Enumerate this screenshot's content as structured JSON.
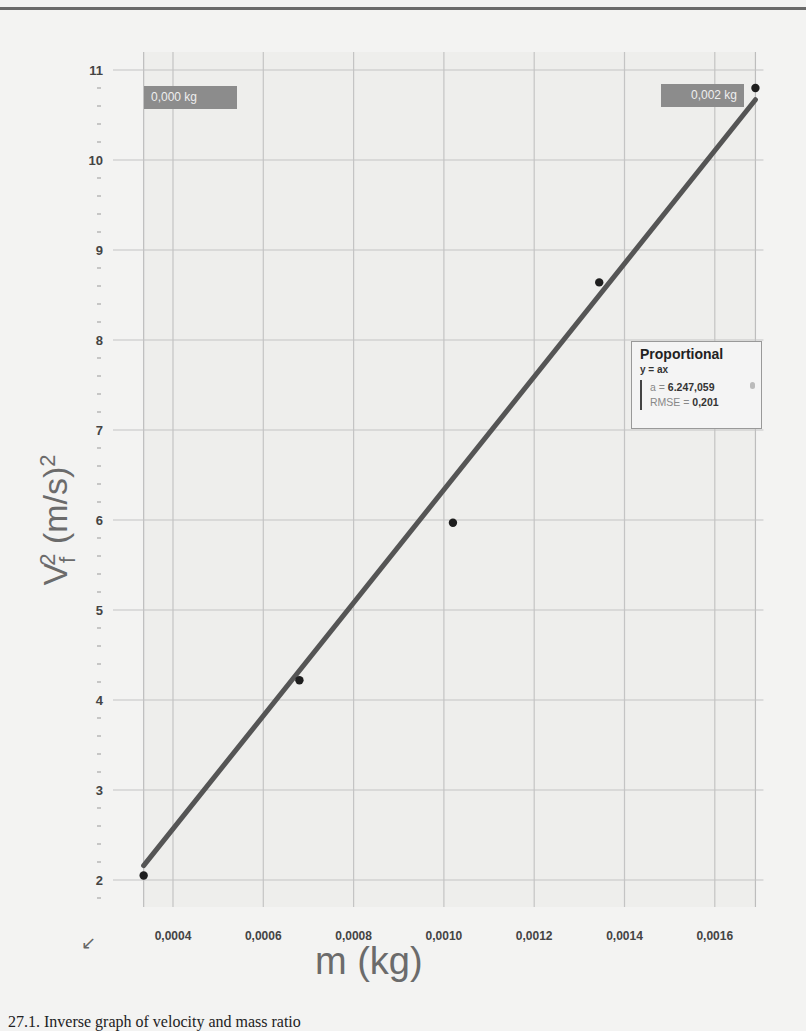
{
  "chart_data": {
    "type": "scatter",
    "title": "",
    "xlabel": "m (kg)",
    "ylabel": "Vf^2 (m/s)^2",
    "xlim": [
      0.000335,
      0.00169
    ],
    "ylim": [
      1.7,
      11.1
    ],
    "grid": true,
    "x_ticks": [
      "0,0004",
      "0,0006",
      "0,0008",
      "0,0010",
      "0,0012",
      "0,0014",
      "0,0016"
    ],
    "x_tick_values": [
      0.0004,
      0.0006,
      0.0008,
      0.001,
      0.0012,
      0.0014,
      0.0016
    ],
    "y_ticks": [
      "2",
      "3",
      "4",
      "5",
      "6",
      "7",
      "8",
      "9",
      "10",
      "11"
    ],
    "y_tick_values": [
      2,
      3,
      4,
      5,
      6,
      7,
      8,
      9,
      10,
      11
    ],
    "series": [
      {
        "name": "data",
        "x": [
          0.000335,
          0.00068,
          0.00102,
          0.001344,
          0.00169
        ],
        "y": [
          2.05,
          4.22,
          5.97,
          8.64,
          10.8
        ]
      },
      {
        "name": "Proportional fit (y = ax)",
        "type": "line",
        "x": [
          0.000335,
          0.00169
        ],
        "y": [
          2.16,
          10.67
        ]
      }
    ],
    "fit": {
      "title": "Proportional",
      "equation": "y = ax",
      "a_label": "a = ",
      "a_value": "6.247,059",
      "rmse_label": "RMSE = ",
      "rmse_value": "0,201"
    },
    "range_tags": {
      "left": "0,000 kg",
      "right": "0,002 kg"
    }
  },
  "labels": {
    "y_main": "V",
    "y_sub": "f",
    "y_sup": "2",
    "y_unit": " (m/s)",
    "y_unit_sup": "2",
    "x": "m (kg)"
  },
  "caption": "27.1. Inverse graph of velocity and mass ratio",
  "icons": {
    "corner": "↙"
  }
}
